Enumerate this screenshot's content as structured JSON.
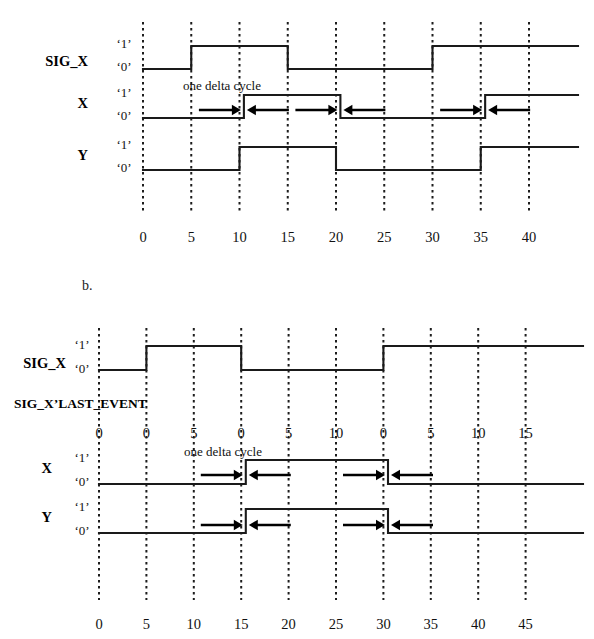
{
  "page": {
    "background_color": "#ffffff",
    "line_color": "#1a1a1a",
    "gridline_color": "#1d1d1d"
  },
  "figures": [
    {
      "id": "a",
      "label": "",
      "annotation": "one delta cycle",
      "signal_labels": [
        "SIG_X",
        "X",
        "Y"
      ],
      "level_high": "‘1’",
      "level_low": "‘0’",
      "axis": {
        "ticks": [
          "0",
          "5",
          "10",
          "15",
          "20",
          "25",
          "30",
          "35",
          "40"
        ],
        "values": [
          0,
          5,
          10,
          15,
          20,
          25,
          30,
          35,
          40
        ],
        "grid": true
      },
      "waveforms": [
        {
          "name": "SIG_X",
          "delta_delayed": false,
          "transitions": [
            {
              "time": 0,
              "level": 0
            },
            {
              "time": 5,
              "level": 1
            },
            {
              "time": 15,
              "level": 0
            },
            {
              "time": 30,
              "level": 1
            }
          ]
        },
        {
          "name": "X",
          "delta_delayed": true,
          "transitions": [
            {
              "time": 0,
              "level": 0
            },
            {
              "time": 10,
              "level": 1
            },
            {
              "time": 20,
              "level": 0
            },
            {
              "time": 35,
              "level": 1
            }
          ]
        },
        {
          "name": "Y",
          "delta_delayed": false,
          "transitions": [
            {
              "time": 0,
              "level": 0
            },
            {
              "time": 10,
              "level": 1
            },
            {
              "time": 20,
              "level": 0
            },
            {
              "time": 35,
              "level": 1
            }
          ]
        }
      ],
      "delta_markers": [
        {
          "time": 10,
          "row": "X"
        },
        {
          "time": 20,
          "row": "X"
        },
        {
          "time": 35,
          "row": "X"
        }
      ]
    },
    {
      "id": "b",
      "label": "b.",
      "annotation": "one delta cycle",
      "signal_labels": [
        "SIG_X",
        "X",
        "Y"
      ],
      "last_event_label": "SIG_X’LAST_EVENT",
      "level_high": "‘1’",
      "level_low": "‘0’",
      "axis": {
        "ticks": [
          "0",
          "5",
          "10",
          "15",
          "20",
          "25",
          "30",
          "35",
          "40",
          "45"
        ],
        "values": [
          0,
          5,
          10,
          15,
          20,
          25,
          30,
          35,
          40,
          45
        ],
        "grid": true
      },
      "last_event_ticks": [
        "0",
        "0",
        "5",
        "0",
        "5",
        "10",
        "0",
        "5",
        "10",
        "15"
      ],
      "waveforms": [
        {
          "name": "SIG_X",
          "delta_delayed": false,
          "transitions": [
            {
              "time": 0,
              "level": 0
            },
            {
              "time": 5,
              "level": 1
            },
            {
              "time": 15,
              "level": 0
            },
            {
              "time": 30,
              "level": 1
            }
          ]
        },
        {
          "name": "X",
          "delta_delayed": true,
          "transitions": [
            {
              "time": 0,
              "level": 0
            },
            {
              "time": 15,
              "level": 1
            },
            {
              "time": 30,
              "level": 0
            }
          ]
        },
        {
          "name": "Y",
          "delta_delayed": true,
          "transitions": [
            {
              "time": 0,
              "level": 0
            },
            {
              "time": 15,
              "level": 1
            },
            {
              "time": 30,
              "level": 0
            }
          ]
        }
      ],
      "delta_markers": [
        {
          "time": 15,
          "row": "X"
        },
        {
          "time": 30,
          "row": "X"
        },
        {
          "time": 15,
          "row": "Y"
        },
        {
          "time": 30,
          "row": "Y"
        }
      ]
    }
  ],
  "chart_data": {
    "type": "line",
    "xlabel": "time (ns)",
    "ylabel": "logic level",
    "grid": true,
    "panels": [
      {
        "panel": "a",
        "xlim": [
          0,
          44
        ],
        "xticks": [
          0,
          5,
          10,
          15,
          20,
          25,
          30,
          35,
          40
        ],
        "series": [
          {
            "name": "SIG_X",
            "ylim": [
              0,
              1
            ],
            "steps": [
              [
                0,
                0
              ],
              [
                5,
                0
              ],
              [
                5,
                1
              ],
              [
                15,
                1
              ],
              [
                15,
                0
              ],
              [
                30,
                0
              ],
              [
                30,
                1
              ],
              [
                44,
                1
              ]
            ]
          },
          {
            "name": "X",
            "ylim": [
              0,
              1
            ],
            "note": "delayed by one delta cycle",
            "steps": [
              [
                0,
                0
              ],
              [
                10.4,
                0
              ],
              [
                10.4,
                1
              ],
              [
                20.4,
                1
              ],
              [
                20.4,
                0
              ],
              [
                35.4,
                0
              ],
              [
                35.4,
                1
              ],
              [
                44,
                1
              ]
            ]
          },
          {
            "name": "Y",
            "ylim": [
              0,
              1
            ],
            "steps": [
              [
                0,
                0
              ],
              [
                10,
                0
              ],
              [
                10,
                1
              ],
              [
                20,
                1
              ],
              [
                20,
                0
              ],
              [
                35,
                0
              ],
              [
                35,
                1
              ],
              [
                44,
                1
              ]
            ]
          }
        ]
      },
      {
        "panel": "b",
        "xlim": [
          0,
          47
        ],
        "xticks": [
          0,
          5,
          10,
          15,
          20,
          25,
          30,
          35,
          40,
          45
        ],
        "secondary_axis": {
          "name": "SIG_X'LAST_EVENT",
          "ticks": [
            0,
            0,
            5,
            0,
            5,
            10,
            0,
            5,
            10,
            15
          ]
        },
        "series": [
          {
            "name": "SIG_X",
            "ylim": [
              0,
              1
            ],
            "steps": [
              [
                0,
                0
              ],
              [
                5,
                0
              ],
              [
                5,
                1
              ],
              [
                15,
                1
              ],
              [
                15,
                0
              ],
              [
                30,
                0
              ],
              [
                30,
                1
              ],
              [
                47,
                1
              ]
            ]
          },
          {
            "name": "X",
            "ylim": [
              0,
              1
            ],
            "note": "delayed by one delta cycle",
            "steps": [
              [
                0,
                0
              ],
              [
                15.4,
                0
              ],
              [
                15.4,
                1
              ],
              [
                30.4,
                1
              ],
              [
                30.4,
                0
              ],
              [
                47,
                0
              ]
            ]
          },
          {
            "name": "Y",
            "ylim": [
              0,
              1
            ],
            "note": "delayed by one delta cycle",
            "steps": [
              [
                0,
                0
              ],
              [
                15.4,
                0
              ],
              [
                15.4,
                1
              ],
              [
                30.4,
                1
              ],
              [
                30.4,
                0
              ],
              [
                47,
                0
              ]
            ]
          }
        ]
      }
    ]
  }
}
